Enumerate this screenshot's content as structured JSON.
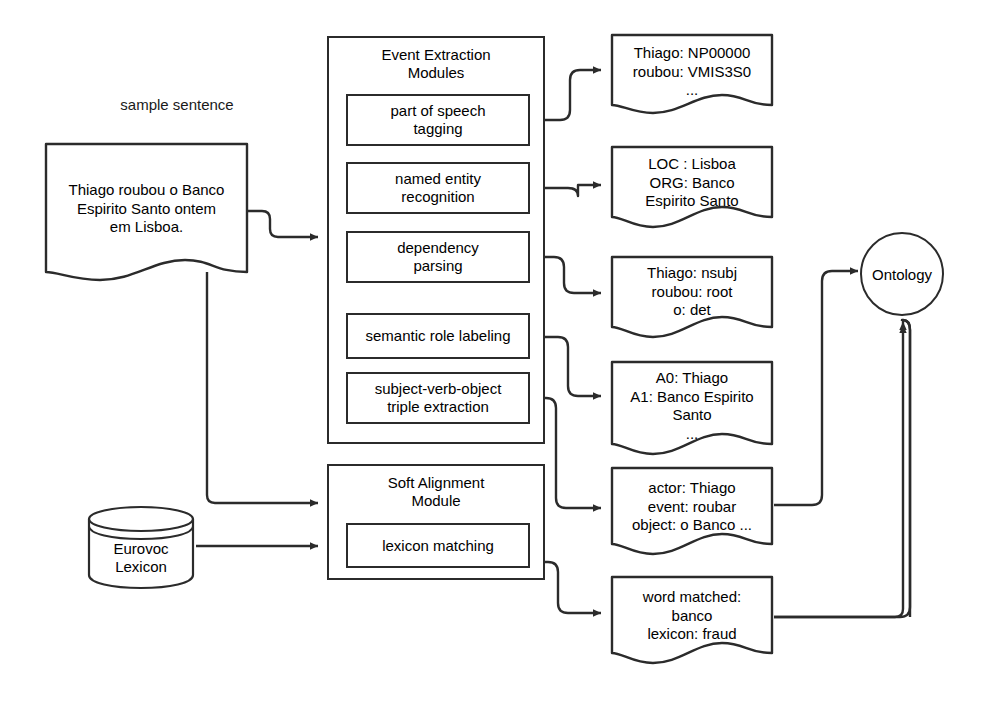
{
  "diagram": {
    "caption": "sample sentence",
    "sample_sentence": "Thiago roubou o Banco\nEspirito Santo ontem\nem Lisboa.",
    "event_module": {
      "title": "Event Extraction\nModules",
      "steps": [
        "part of speech\ntagging",
        "named entity\nrecognition",
        "dependency\nparsing",
        "semantic role labeling",
        "subject-verb-object\ntriple extraction"
      ]
    },
    "alignment_module": {
      "title": "Soft Alignment\nModule",
      "steps": [
        "lexicon matching"
      ]
    },
    "lexicon": "Eurovoc\nLexicon",
    "ontology": "Ontology",
    "outputs": [
      "Thiago: NP00000\nroubou: VMIS3S0\n...",
      "LOC : Lisboa\nORG: Banco\nEspirito Santo",
      "Thiago: nsubj\nroubou: root\no: det",
      "A0: Thiago\nA1: Banco Espirito\nSanto\n...",
      "actor: Thiago\nevent: roubar\nobject: o Banco ...",
      "word matched:\nbanco\nlexicon: fraud"
    ],
    "colors": {
      "stroke": "#2b2b2b",
      "text": "#1a1a1a",
      "background": "#ffffff"
    }
  }
}
